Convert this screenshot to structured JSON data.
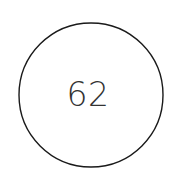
{
  "canvas": {
    "width": 176,
    "height": 192,
    "background_color": "#ffffff"
  },
  "diagram": {
    "type": "single-node-circle",
    "node": {
      "shape": "circle",
      "label": "62",
      "center_x": 91,
      "center_y": 95,
      "radius": 72,
      "stroke_color": "#1a1a1a",
      "stroke_width": 1.4,
      "fill_color": "#ffffff",
      "text_color": "#333333",
      "text_x": 88,
      "text_y": 95,
      "font_size": 33
    }
  }
}
